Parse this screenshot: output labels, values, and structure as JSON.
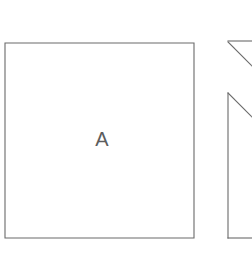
{
  "canvas": {
    "width": 252,
    "height": 254,
    "background_color": "#ffffff"
  },
  "style": {
    "stroke_color": "#6a6a6a",
    "stroke_width": 1.1,
    "label_color": "#5d5d5d",
    "label_font_size": 20
  },
  "figure": {
    "title": "",
    "shapes": [
      {
        "id": "shape-a",
        "name": "square",
        "label": "A",
        "label_x": 102,
        "label_y": 146,
        "clipped": false,
        "points": "5,43 194,43 194,238 5,238",
        "bounds": {
          "x": 5,
          "y": 43,
          "width": 189,
          "height": 195
        }
      },
      {
        "id": "shape-b-upper",
        "name": "clipped-triangle-upper",
        "label": "",
        "clipped": true,
        "segments": [
          {
            "x1": 228,
            "y1": 41,
            "x2": 252,
            "y2": 41
          },
          {
            "x1": 228,
            "y1": 42,
            "x2": 252,
            "y2": 66
          }
        ]
      },
      {
        "id": "shape-b-lower",
        "name": "clipped-polygon-lower",
        "label": "",
        "clipped": true,
        "segments": [
          {
            "x1": 228,
            "y1": 93,
            "x2": 228,
            "y2": 238
          },
          {
            "x1": 228,
            "y1": 93,
            "x2": 252,
            "y2": 117
          },
          {
            "x1": 228,
            "y1": 238,
            "x2": 252,
            "y2": 238
          }
        ]
      }
    ]
  }
}
